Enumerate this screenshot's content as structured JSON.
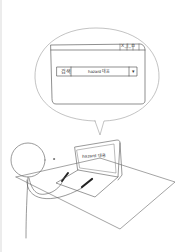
{
  "scene": {
    "description": "hand-drawn comic of a stick figure typing on a laptop, with a speech bubble showing a search window",
    "stroke_color": "#555555",
    "background": "#ffffff"
  },
  "bubble": {
    "window": {
      "title_buttons": "X_|_ㅁ",
      "search": {
        "label": "검색",
        "value": "hazard 대응",
        "dropdown_icon": "▾"
      }
    }
  },
  "laptop": {
    "screen_text": "hazard 대응"
  }
}
